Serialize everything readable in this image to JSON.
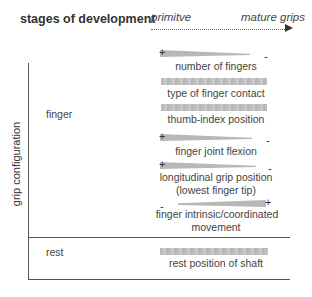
{
  "header": {
    "title": "stages of development",
    "stage_start": "primitve",
    "stage_end": "mature grips"
  },
  "axis": {
    "y_label": "grip configuration"
  },
  "categories": [
    {
      "name": "finger",
      "parameters": [
        {
          "label": "number of fingers",
          "trend": "decreasing",
          "left_sign": "+",
          "right_sign": "-"
        },
        {
          "label": "type of finger contact",
          "trend": "flat",
          "left_sign": "",
          "right_sign": ""
        },
        {
          "label": "thumb-index position",
          "trend": "flat",
          "left_sign": "",
          "right_sign": ""
        },
        {
          "label": "finger joint flexion",
          "trend": "decreasing",
          "left_sign": "+",
          "right_sign": "-"
        },
        {
          "label": "longitudinal grip position",
          "label_line2": "(lowest finger tip)",
          "trend": "decreasing",
          "left_sign": "+",
          "right_sign": "-"
        },
        {
          "label": "finger intrinsic/coordinated",
          "label_line2": "movement",
          "trend": "increasing",
          "left_sign": "-",
          "right_sign": "+"
        }
      ]
    },
    {
      "name": "rest",
      "parameters": [
        {
          "label": "rest position of shaft",
          "trend": "flat",
          "left_sign": "",
          "right_sign": ""
        }
      ]
    }
  ],
  "colors": {
    "bar": "#b8b8b8",
    "line": "#555555",
    "text": "#333333"
  }
}
